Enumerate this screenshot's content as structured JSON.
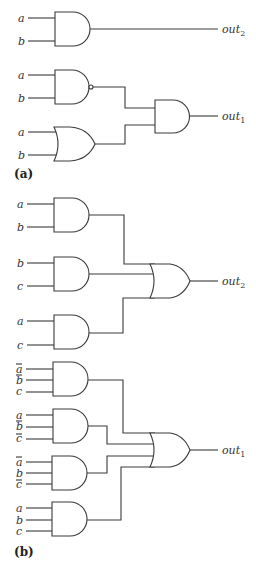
{
  "diagram": {
    "part_a": {
      "label": "(a)",
      "circuit_out2": {
        "gates": [
          {
            "id": "a_and1",
            "type": "AND",
            "inputs": [
              "a",
              "b"
            ]
          }
        ],
        "output": {
          "name": "out",
          "sub": "2"
        }
      },
      "circuit_out1": {
        "gates": [
          {
            "id": "a_nand",
            "type": "NAND",
            "inputs": [
              "a",
              "b"
            ]
          },
          {
            "id": "a_or",
            "type": "OR",
            "inputs": [
              "a",
              "b"
            ]
          },
          {
            "id": "a_and2",
            "type": "AND",
            "inputs": [
              "a_nand",
              "a_or"
            ]
          }
        ],
        "output": {
          "name": "out",
          "sub": "1"
        }
      },
      "labels": {
        "g1_in1": "a",
        "g1_in2": "b",
        "g2_in1": "a",
        "g2_in2": "b",
        "g3_in1": "a",
        "g3_in2": "b",
        "out2": "out",
        "out2_sub": "2",
        "out1": "out",
        "out1_sub": "1"
      }
    },
    "part_b": {
      "label": "(b)",
      "circuit_out2": {
        "gates": [
          {
            "id": "b_and1",
            "type": "AND",
            "inputs": [
              "a",
              "b"
            ]
          },
          {
            "id": "b_and2",
            "type": "AND",
            "inputs": [
              "b",
              "c"
            ]
          },
          {
            "id": "b_and3",
            "type": "AND",
            "inputs": [
              "a",
              "c"
            ]
          },
          {
            "id": "b_or1",
            "type": "OR",
            "inputs": [
              "b_and1",
              "b_and2",
              "b_and3"
            ]
          }
        ],
        "output": {
          "name": "out",
          "sub": "2"
        }
      },
      "circuit_out1": {
        "gates": [
          {
            "id": "b_and4",
            "type": "AND",
            "inputs": [
              "a̅",
              "b̅",
              "c"
            ]
          },
          {
            "id": "b_and5",
            "type": "AND",
            "inputs": [
              "a",
              "b̅",
              "c̅"
            ]
          },
          {
            "id": "b_and6",
            "type": "AND",
            "inputs": [
              "a̅",
              "b",
              "c̅"
            ]
          },
          {
            "id": "b_and7",
            "type": "AND",
            "inputs": [
              "a",
              "b",
              "c"
            ]
          },
          {
            "id": "b_or2",
            "type": "OR",
            "inputs": [
              "b_and4",
              "b_and5",
              "b_and6",
              "b_and7"
            ]
          }
        ],
        "output": {
          "name": "out",
          "sub": "1"
        }
      },
      "labels": {
        "g1_in1": "a",
        "g1_in2": "b",
        "g2_in1": "b",
        "g2_in2": "c",
        "g3_in1": "a",
        "g3_in2": "c",
        "g4_in1": "a",
        "g4_in2": "b",
        "g4_in3": "c",
        "g5_in1": "a",
        "g5_in2": "b",
        "g5_in3": "c",
        "g6_in1": "a",
        "g6_in2": "b",
        "g6_in3": "c",
        "g7_in1": "a",
        "g7_in2": "b",
        "g7_in3": "c",
        "out2": "out",
        "out2_sub": "2",
        "out1": "out",
        "out1_sub": "1"
      },
      "negated_inputs": {
        "g4": [
          "a",
          "b"
        ],
        "g5": [
          "b",
          "c"
        ],
        "g6": [
          "a",
          "c"
        ],
        "g7": []
      }
    }
  }
}
